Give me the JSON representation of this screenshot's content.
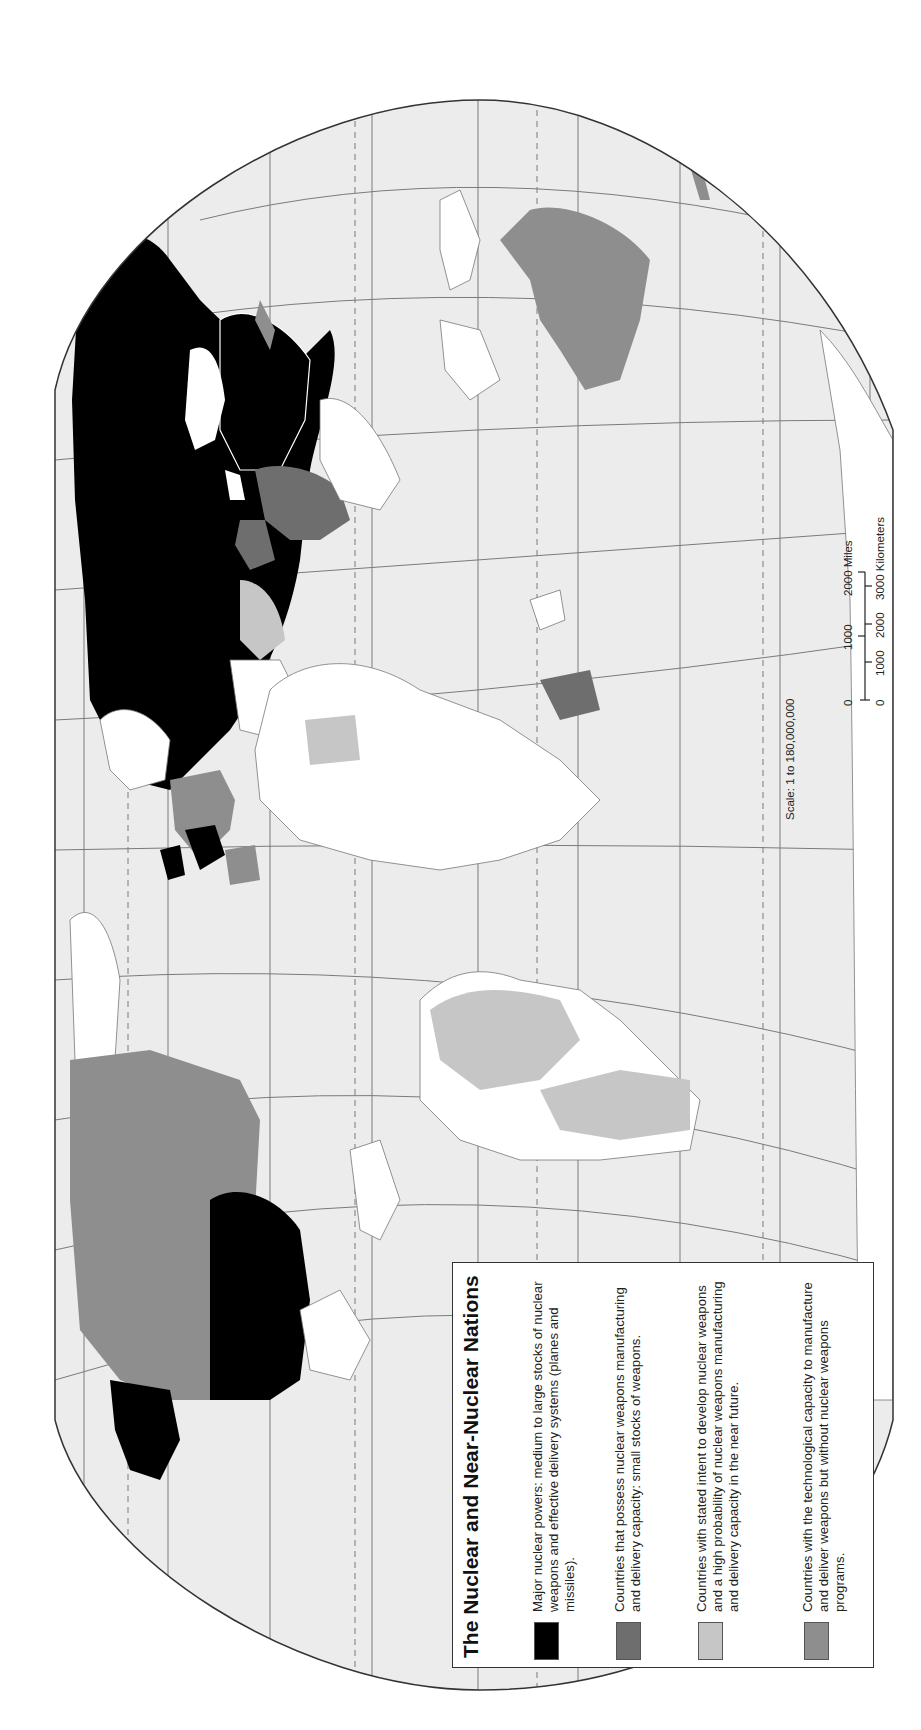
{
  "map": {
    "orientation": "rotated 90 degrees counter-clockwise (north at left)",
    "colors": {
      "ocean": "#ececec",
      "graticule": "#7a7a7a",
      "outline": "#333333",
      "land_other": "#ffffff",
      "major_nuclear": "#000000",
      "possess_small": "#6e6e6e",
      "stated_intent": "#c6c6c6",
      "technological_capacity": "#8e8e8e"
    }
  },
  "legend": {
    "title": "The Nuclear and Near-Nuclear Nations",
    "items": [
      {
        "color": "#000000",
        "label": "Major nuclear powers:  medium to large stocks of nuclear weapons and effective delivery systems (planes and missiles)."
      },
      {
        "color": "#6e6e6e",
        "label": "Countries that possess nuclear weapons manufacturing and delivery capacity: small stocks of weapons."
      },
      {
        "color": "#c6c6c6",
        "label": "Countries with stated intent to develop nuclear weapons and a high probability of nuclear  weapons manufacturing and delivery capacity in the near future."
      },
      {
        "color": "#8e8e8e",
        "label": "Countries with the technological capacity to manufacture and deliver weapons but without nuclear weapons programs."
      }
    ]
  },
  "scale": {
    "text": "Scale:  1 to 180,000,000",
    "miles_ticks": [
      "0",
      "1000",
      "2000 Miles"
    ],
    "km_ticks": [
      "0",
      "1000",
      "2000",
      "3000 Kilometers"
    ]
  }
}
